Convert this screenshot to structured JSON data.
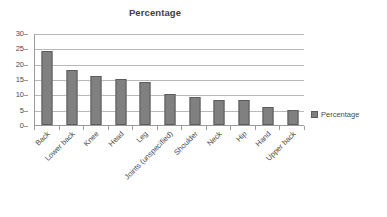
{
  "chart_data": {
    "type": "bar",
    "title": "Percentage",
    "xlabel": "",
    "ylabel": "",
    "ylim": [
      0,
      30
    ],
    "ytick_step": 5,
    "yticks": [
      0,
      5,
      10,
      15,
      20,
      25,
      30
    ],
    "grid": true,
    "legend_position": "right",
    "categories": [
      "Back",
      "Lower back",
      "Knee",
      "Head",
      "Leg",
      "Joints (unspecified)",
      "Shoulder",
      "Neck",
      "Hip",
      "Hand",
      "Upper back"
    ],
    "series": [
      {
        "name": "Percentage",
        "color": "#808080",
        "values": [
          24,
          18,
          16,
          15,
          14,
          10,
          9,
          8,
          8,
          6,
          5
        ]
      }
    ]
  },
  "legend": {
    "entries": [
      {
        "label": "Percentage",
        "color": "#808080"
      }
    ]
  }
}
